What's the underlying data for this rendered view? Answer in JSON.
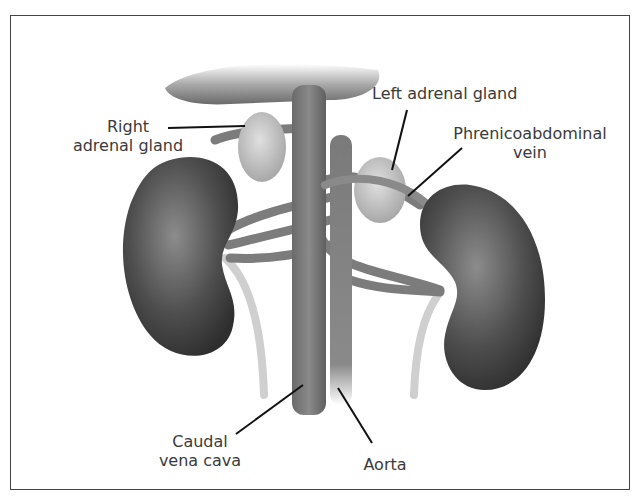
{
  "diagram": {
    "labels": {
      "right_adrenal_gland": "Right\nadrenal gland",
      "left_adrenal_gland": "Left adrenal gland",
      "phrenicoabdominal_vein": "Phrenicoabdominal\nvein",
      "caudal_vena_cava": "Caudal\nvena cava",
      "aorta": "Aorta"
    },
    "colors": {
      "kidney": "#4a4a4a",
      "vessel": "#7a7a7a",
      "adrenal": "#c8c8c8",
      "ureter": "#cfcfcf",
      "text": "#3a3a3a",
      "border": "#444444"
    }
  }
}
